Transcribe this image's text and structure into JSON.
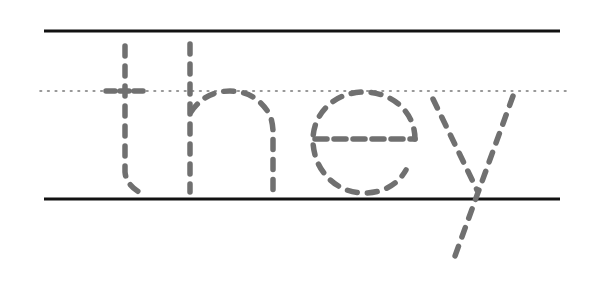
{
  "worksheet": {
    "type": "handwriting tracing practice",
    "word": "they",
    "letters": [
      "t",
      "h",
      "e",
      "y"
    ],
    "guide_lines": {
      "top_line": {
        "y": 31,
        "x1": 44,
        "x2": 560,
        "style": "solid",
        "color": "#111111"
      },
      "mid_line": {
        "y": 91,
        "x1": 40,
        "x2": 566,
        "style": "dotted",
        "color": "#777777"
      },
      "base_line": {
        "y": 199,
        "x1": 44,
        "x2": 560,
        "style": "solid",
        "color": "#111111"
      }
    },
    "trace_color": "#707070",
    "background": "#ffffff"
  }
}
